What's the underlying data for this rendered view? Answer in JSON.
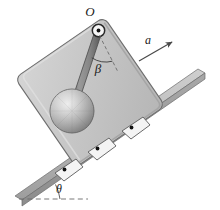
{
  "figure": {
    "type": "physics-free-body-diagram",
    "labels": {
      "pivot": "O",
      "acceleration": "a",
      "rod_angle": "β",
      "incline_angle": "θ"
    },
    "colors": {
      "background": "#ffffff",
      "cart_body": "#c6c6c6",
      "cart_body_edge": "#6e6e6e",
      "cart_highlight": "#d8d8d8",
      "cart_shadow": "#a9a9a9",
      "incline_top": "#bdbdbd",
      "incline_face": "#9a9a9a",
      "incline_edge": "#6b6b6b",
      "rod": "#8a8a8a",
      "rod_edge": "#4a4a4a",
      "sphere_light": "#e2e2e2",
      "sphere_mid": "#b4b4b4",
      "sphere_dark": "#7e7e7e",
      "wheel_fill": "#f2f2f2",
      "wheel_edge": "#5a5a5a",
      "axle_dot": "#111111",
      "dashed_line": "#6a6a6a",
      "arrow": "#4a4a4a",
      "text": "#1a1a1a"
    },
    "geometry": {
      "incline_angle_degrees": 28,
      "rod_angle_degrees": 20,
      "pivot_point": {
        "x": 98,
        "y": 31
      },
      "bob_center": {
        "x": 72,
        "y": 111
      },
      "bob_radius": 22,
      "acceleration_direction": "up-slope"
    },
    "elements": {
      "cart": "cart-body",
      "rod": "pendulum-rod",
      "bob": "pendulum-bob",
      "pivot": "pivot-joint",
      "incline": "incline-surface",
      "wheels": 3,
      "arrow": "acceleration-arrow",
      "angle_arcs": 2,
      "dashed_refs": 2
    }
  }
}
